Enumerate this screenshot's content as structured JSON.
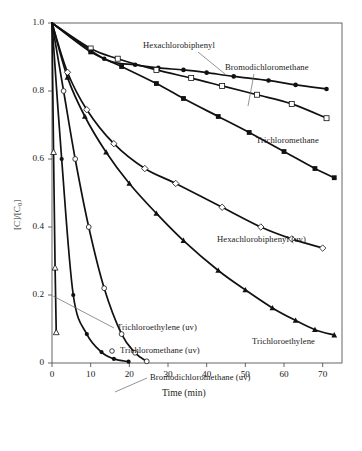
{
  "chart_data": {
    "type": "line",
    "title": "",
    "xlabel": "Time (min)",
    "ylabel": "[C]/[C0]",
    "ylabel_display": "[C]/[C₀]",
    "xlim": [
      0,
      75
    ],
    "ylim": [
      0,
      1.0
    ],
    "xticks": [
      0,
      10,
      20,
      30,
      40,
      50,
      60,
      70
    ],
    "yticks": [
      0,
      0.2,
      0.4,
      0.6,
      0.8,
      1.0
    ],
    "xtick_labels": [
      "0",
      "10",
      "20",
      "30",
      "40",
      "50",
      "60",
      "70"
    ],
    "ytick_labels": [
      "0",
      "0.2",
      "0.4",
      "0.6",
      "0.8",
      "1.0"
    ],
    "grid": false,
    "legend_position": "inline-annotations",
    "series": [
      {
        "name": "Bromodichloromethane",
        "marker": "filled-circle",
        "x": [
          0,
          13.5,
          21.5,
          27.5,
          34,
          40,
          47,
          56,
          63,
          71
        ],
        "y": [
          1.0,
          0.895,
          0.877,
          0.868,
          0.862,
          0.854,
          0.843,
          0.831,
          0.818,
          0.806
        ]
      },
      {
        "name": "Hexachlorobiphenyl",
        "marker": "open-square",
        "x": [
          0,
          10,
          17,
          27,
          36,
          44,
          53,
          62,
          71
        ],
        "y": [
          1.0,
          0.925,
          0.895,
          0.862,
          0.838,
          0.815,
          0.789,
          0.762,
          0.72
        ]
      },
      {
        "name": "Trichloromethane",
        "marker": "filled-square",
        "x": [
          0,
          10,
          18,
          27,
          34,
          43,
          51,
          60,
          68,
          73
        ],
        "y": [
          1.0,
          0.915,
          0.872,
          0.822,
          0.778,
          0.725,
          0.678,
          0.622,
          0.572,
          0.545
        ]
      },
      {
        "name": "Hexachlorobiphenyl (uv)",
        "marker": "open-diamond",
        "x": [
          0,
          4,
          9,
          16,
          24,
          32,
          44,
          54,
          62,
          70
        ],
        "y": [
          1.0,
          0.855,
          0.745,
          0.645,
          0.572,
          0.528,
          0.458,
          0.4,
          0.365,
          0.338
        ]
      },
      {
        "name": "Trichloroethylene",
        "marker": "filled-triangle",
        "x": [
          0,
          4,
          8.5,
          14,
          20,
          27,
          34,
          43,
          50,
          57,
          63,
          68,
          73
        ],
        "y": [
          1.0,
          0.84,
          0.725,
          0.62,
          0.528,
          0.44,
          0.36,
          0.272,
          0.215,
          0.162,
          0.125,
          0.098,
          0.082
        ]
      },
      {
        "name": "Trichloroethylene (uv)",
        "marker": "open-triangle",
        "x": [
          0,
          0.4,
          0.8,
          1.1
        ],
        "y": [
          1.0,
          0.62,
          0.28,
          0.09
        ]
      },
      {
        "name": "Trichloromethane (uv)",
        "marker": "open-circle",
        "x": [
          0,
          3,
          6,
          9.5,
          13.5,
          18,
          21.5,
          24.5
        ],
        "y": [
          1.0,
          0.8,
          0.6,
          0.4,
          0.22,
          0.085,
          0.03,
          0.005
        ]
      },
      {
        "name": "Bromodichloromethane (uv)",
        "marker": "filled-circle-small",
        "x": [
          0,
          2.5,
          5.5,
          9,
          12.8,
          16,
          19.8
        ],
        "y": [
          1.0,
          0.6,
          0.2,
          0.085,
          0.032,
          0.012,
          0.004
        ]
      }
    ],
    "annotations": [
      {
        "id": "ann-hexachlorobiphenyl",
        "text": "Hexachlorobiphenyl"
      },
      {
        "id": "ann-bromodichloromethane",
        "text": "Bromodichloromethane"
      },
      {
        "id": "ann-trichloromethane",
        "text": "Trichloromethane"
      },
      {
        "id": "ann-hexachlorobiphenyl-uv",
        "text": "Hexachlorobiphenyl (uv)"
      },
      {
        "id": "ann-trichloroethylene",
        "text": "Trichloroethylene"
      },
      {
        "id": "ann-trichloroethylene-uv",
        "text": "Trichloroethylene (uv)"
      },
      {
        "id": "ann-trichloromethane-uv",
        "text": "Trichloromethane (uv)"
      },
      {
        "id": "ann-bromodichloromethane-uv",
        "text": "Bromodichloromethane (uv)"
      }
    ],
    "colors": {
      "line": "#111111",
      "axis": "#555555",
      "text": "#1a1a1a",
      "marker_fill": "#111111",
      "marker_open_fill": "#ffffff",
      "background": "#ffffff"
    }
  }
}
